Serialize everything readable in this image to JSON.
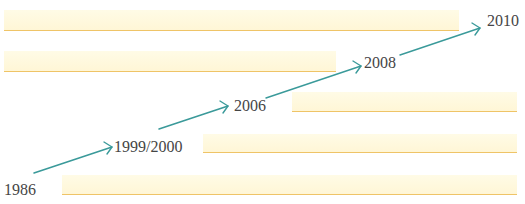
{
  "timeline": {
    "milestones": [
      {
        "label": "1986"
      },
      {
        "label": "1999/2000"
      },
      {
        "label": "2006"
      },
      {
        "label": "2008"
      },
      {
        "label": "2010"
      }
    ],
    "arrow_count": 4,
    "bar_count": 5
  },
  "colors": {
    "bar_fill": "#fff8dc",
    "bar_underline": "#efc467",
    "arrow": "#3a9a9a",
    "text": "#454545",
    "background": "#ffffff"
  }
}
